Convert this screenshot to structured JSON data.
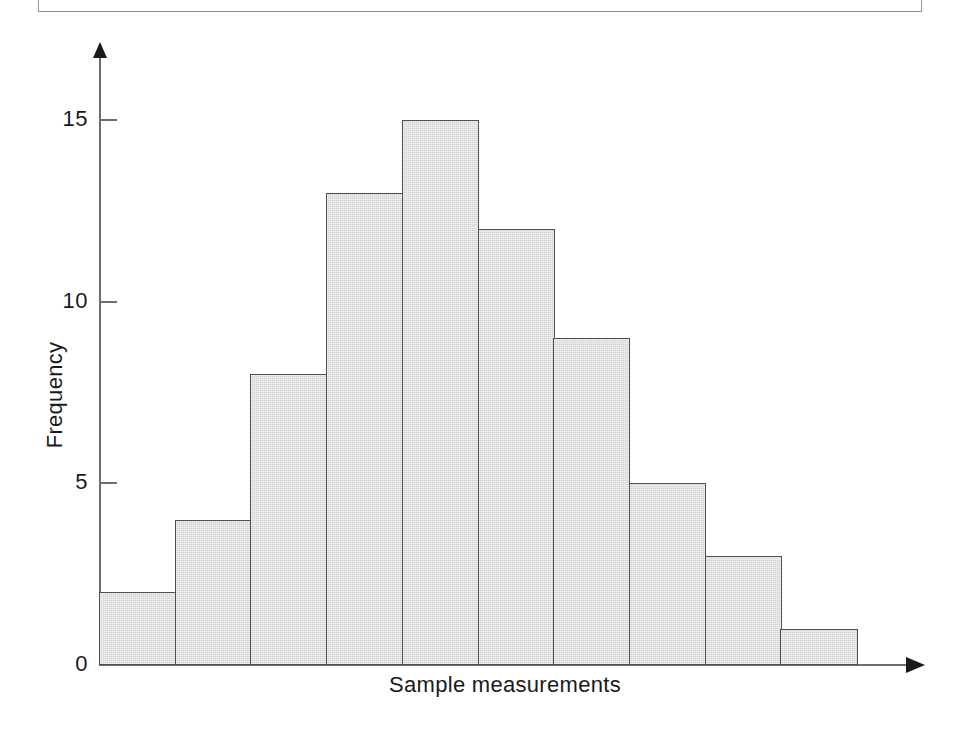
{
  "figure": {
    "frame_visible": true,
    "background_color": "#ffffff"
  },
  "chart_data": {
    "type": "bar",
    "title": "",
    "subtitle": "",
    "xlabel": "Sample measurements",
    "ylabel": "Frequency",
    "categories": [
      "1",
      "2",
      "3",
      "4",
      "5",
      "6",
      "7",
      "8",
      "9",
      "10"
    ],
    "values": [
      2,
      4,
      8,
      13,
      15,
      12,
      9,
      5,
      3,
      1
    ],
    "ylim": [
      0,
      16.5
    ],
    "y_ticks": [
      0,
      5,
      10,
      15
    ],
    "y_tick_labels": [
      "0",
      "5",
      "10",
      "15"
    ],
    "x_ticks": [],
    "x_tick_labels": [],
    "grid": false,
    "legend": null,
    "legend_position": "none",
    "bar_fill_color": "#d2d2d2",
    "bar_edge_color": "#4f4f4f",
    "axis_color": "#6e6e6e",
    "text_color": "#1a1a1a",
    "annotations": []
  },
  "axes": {
    "y_arrow": "up-arrow-icon",
    "x_arrow": "right-arrow-icon"
  }
}
